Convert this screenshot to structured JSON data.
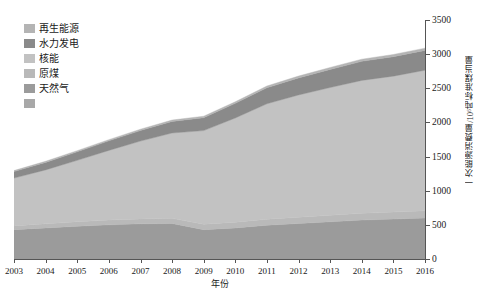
{
  "legend": {
    "items": [
      {
        "label": "再生能源",
        "color": "#b4b4b4"
      },
      {
        "label": "水力发电",
        "color": "#8a8a8a"
      },
      {
        "label": "核能",
        "color": "#c2c2c2"
      },
      {
        "label": "原煤",
        "color": "#b9b9b9"
      },
      {
        "label": "天然气",
        "color": "#9b9b9b"
      },
      {
        "label": "",
        "color": "#a8a8a8"
      }
    ]
  },
  "chart_data": {
    "type": "area",
    "stacked": true,
    "title": "",
    "xlabel": "年份",
    "ylabel": "一次能源消费量/10⁶吨标准煤当量",
    "x": [
      2003,
      2004,
      2005,
      2006,
      2007,
      2008,
      2009,
      2010,
      2011,
      2012,
      2013,
      2014,
      2015,
      2016
    ],
    "xlim": [
      2003,
      2016
    ],
    "ylim": [
      0,
      3500
    ],
    "yticks": [
      0,
      500,
      1000,
      1500,
      2000,
      2500,
      3000,
      3500
    ],
    "grid": false,
    "legend_position": "top-left",
    "series": [
      {
        "name": "天然气",
        "color": "#9b9b9b",
        "values": [
          430,
          455,
          480,
          500,
          515,
          520,
          430,
          455,
          495,
          520,
          545,
          570,
          585,
          600
        ]
      },
      {
        "name": "原煤",
        "color": "#b9b9b9",
        "values": [
          55,
          60,
          65,
          70,
          72,
          75,
          80,
          85,
          88,
          92,
          96,
          100,
          103,
          105
        ]
      },
      {
        "name": "核能",
        "color": "#c2c2c2",
        "values": [
          700,
          790,
          900,
          1020,
          1140,
          1250,
          1370,
          1525,
          1690,
          1790,
          1870,
          1945,
          1990,
          2060
        ]
      },
      {
        "name": "水力发电",
        "color": "#8a8a8a",
        "values": [
          95,
          110,
          125,
          140,
          155,
          170,
          190,
          215,
          235,
          250,
          265,
          280,
          285,
          290
        ]
      },
      {
        "name": "再生能源",
        "color": "#b4b4b4",
        "values": [
          15,
          16,
          17,
          18,
          19,
          20,
          21,
          23,
          25,
          27,
          29,
          31,
          32,
          33
        ]
      }
    ],
    "totals": [
      1295,
      1431,
      1587,
      1748,
      1901,
      2035,
      2091,
      2303,
      2533,
      2679,
      2805,
      2926,
      2995,
      3088
    ]
  }
}
